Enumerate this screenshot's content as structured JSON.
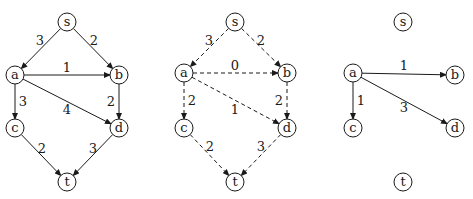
{
  "node_radius": 9,
  "graphs": [
    {
      "name": "original-flow-network",
      "style": "solid",
      "nodes": [
        {
          "id": "s",
          "x": 67,
          "y": 22
        },
        {
          "id": "a",
          "x": 15,
          "y": 75
        },
        {
          "id": "b",
          "x": 119,
          "y": 75
        },
        {
          "id": "c",
          "x": 15,
          "y": 128
        },
        {
          "id": "d",
          "x": 119,
          "y": 128
        },
        {
          "id": "t",
          "x": 67,
          "y": 182
        }
      ],
      "edges": [
        {
          "from": "s",
          "to": "a",
          "label": "3",
          "lx": 40,
          "ly": 40
        },
        {
          "from": "s",
          "to": "b",
          "label": "2",
          "lx": 94,
          "ly": 40
        },
        {
          "from": "a",
          "to": "b",
          "label": "1",
          "lx": 67,
          "ly": 67
        },
        {
          "from": "a",
          "to": "c",
          "label": "3",
          "lx": 23,
          "ly": 101
        },
        {
          "from": "a",
          "to": "d",
          "label": "4",
          "lx": 67,
          "ly": 109
        },
        {
          "from": "b",
          "to": "d",
          "label": "2",
          "lx": 111,
          "ly": 101
        },
        {
          "from": "c",
          "to": "t",
          "label": "2",
          "lx": 42,
          "ly": 148
        },
        {
          "from": "d",
          "to": "t",
          "label": "3",
          "lx": 93,
          "ly": 148
        }
      ]
    },
    {
      "name": "dashed-flow-network",
      "style": "dashed",
      "nodes": [
        {
          "id": "s",
          "x": 235,
          "y": 22
        },
        {
          "id": "a",
          "x": 184,
          "y": 73
        },
        {
          "id": "b",
          "x": 287,
          "y": 73
        },
        {
          "id": "c",
          "x": 184,
          "y": 128
        },
        {
          "id": "d",
          "x": 287,
          "y": 128
        },
        {
          "id": "t",
          "x": 235,
          "y": 182
        }
      ],
      "edges": [
        {
          "from": "s",
          "to": "a",
          "label": "3",
          "lx": 209,
          "ly": 40
        },
        {
          "from": "s",
          "to": "b",
          "label": "2",
          "lx": 261,
          "ly": 40
        },
        {
          "from": "a",
          "to": "b",
          "label": "0",
          "lx": 235,
          "ly": 65
        },
        {
          "from": "a",
          "to": "c",
          "label": "2",
          "lx": 192,
          "ly": 100
        },
        {
          "from": "a",
          "to": "d",
          "label": "1",
          "lx": 235,
          "ly": 109
        },
        {
          "from": "b",
          "to": "d",
          "label": "2",
          "lx": 279,
          "ly": 100
        },
        {
          "from": "c",
          "to": "t",
          "label": "2",
          "lx": 210,
          "ly": 146
        },
        {
          "from": "d",
          "to": "t",
          "label": "3",
          "lx": 261,
          "ly": 146
        }
      ]
    },
    {
      "name": "residual-subgraph",
      "style": "solid",
      "nodes": [
        {
          "id": "s",
          "x": 403,
          "y": 22
        },
        {
          "id": "a",
          "x": 353,
          "y": 73
        },
        {
          "id": "b",
          "x": 455,
          "y": 75
        },
        {
          "id": "c",
          "x": 353,
          "y": 128
        },
        {
          "id": "d",
          "x": 455,
          "y": 128
        },
        {
          "id": "t",
          "x": 403,
          "y": 182
        }
      ],
      "edges": [
        {
          "from": "a",
          "to": "b",
          "label": "1",
          "lx": 404,
          "ly": 65
        },
        {
          "from": "a",
          "to": "c",
          "label": "1",
          "lx": 361,
          "ly": 100
        },
        {
          "from": "a",
          "to": "d",
          "label": "3",
          "lx": 404,
          "ly": 107
        }
      ]
    }
  ]
}
